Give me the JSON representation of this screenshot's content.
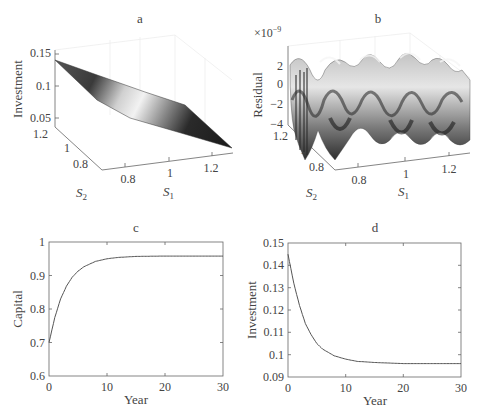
{
  "chart_data": [
    {
      "panel": "a",
      "type": "surface3d",
      "title": "a",
      "xlabel": "S1",
      "ylabel": "S2",
      "zlabel": "Investment",
      "x_ticks": [
        "0.8",
        "1",
        "1.2"
      ],
      "y_ticks": [
        "0.8",
        "1",
        "1.2"
      ],
      "z_ticks": [
        "0.05",
        "0.1",
        "0.15"
      ],
      "zlim": [
        0.05,
        0.15
      ],
      "description": "Planar-like decreasing investment surface from ~0.14 at low S1 to ~0.05 at high S1",
      "corner_values": {
        "S1_low": 0.14,
        "S1_high": 0.05
      },
      "colormap": "gray"
    },
    {
      "panel": "b",
      "type": "surface3d",
      "title": "b",
      "xlabel": "S1",
      "ylabel": "S2",
      "zlabel": "Residual",
      "z_multiplier": "×10^-9",
      "x_ticks": [
        "0.8",
        "1",
        "1.2"
      ],
      "y_ticks": [
        "0.8",
        "1",
        "1.2"
      ],
      "z_ticks": [
        "-4",
        "-2",
        "0",
        "2"
      ],
      "zlim": [
        -4,
        2.5
      ],
      "description": "Oscillatory residual surface of order 1e-9",
      "colormap": "gray"
    },
    {
      "panel": "c",
      "type": "line",
      "title": "c",
      "xlabel": "Year",
      "ylabel": "Capital",
      "xlim": [
        0,
        30
      ],
      "ylim": [
        0.6,
        1.0
      ],
      "x_ticks": [
        "0",
        "10",
        "20",
        "30"
      ],
      "y_ticks": [
        "0.6",
        "0.7",
        "0.8",
        "0.9",
        "1"
      ],
      "grid": false,
      "series": [
        {
          "name": "Capital",
          "x": [
            0,
            1,
            2,
            3,
            4,
            5,
            6,
            8,
            10,
            12,
            15,
            20,
            25,
            30
          ],
          "values": [
            0.7,
            0.775,
            0.83,
            0.868,
            0.895,
            0.913,
            0.926,
            0.942,
            0.95,
            0.954,
            0.957,
            0.958,
            0.958,
            0.958
          ]
        }
      ]
    },
    {
      "panel": "d",
      "type": "line",
      "title": "d",
      "xlabel": "Year",
      "ylabel": "Investment",
      "xlim": [
        0,
        30
      ],
      "ylim": [
        0.09,
        0.15
      ],
      "x_ticks": [
        "0",
        "10",
        "20",
        "30"
      ],
      "y_ticks": [
        "0.09",
        "0.1",
        "0.11",
        "0.12",
        "0.13",
        "0.14",
        "0.15"
      ],
      "grid": false,
      "series": [
        {
          "name": "Investment",
          "x": [
            0,
            1,
            2,
            3,
            4,
            5,
            6,
            8,
            10,
            12,
            15,
            20,
            25,
            30
          ],
          "values": [
            0.145,
            0.132,
            0.122,
            0.114,
            0.109,
            0.105,
            0.1025,
            0.0995,
            0.098,
            0.097,
            0.0965,
            0.096,
            0.096,
            0.096
          ]
        }
      ]
    }
  ],
  "labels": {
    "a": {
      "title": "a",
      "z": "Investment",
      "x": "S",
      "x_sub": "1",
      "y": "S",
      "y_sub": "2",
      "zt": [
        "0.15",
        "0.1",
        "0.05"
      ],
      "yt": [
        "1.2",
        "1",
        "0.8"
      ],
      "xt": [
        "0.8",
        "1",
        "1.2"
      ]
    },
    "b": {
      "title": "b",
      "z": "Residual",
      "mult": "×10",
      "mult_exp": "−9",
      "x": "S",
      "x_sub": "1",
      "y": "S",
      "y_sub": "2",
      "zt": [
        "2",
        "0",
        "−2",
        "−4"
      ],
      "yt": [
        "1.2",
        "1",
        "0.8"
      ],
      "xt": [
        "0.8",
        "1",
        "1.2"
      ]
    },
    "c": {
      "title": "c",
      "y": "Capital",
      "x": "Year",
      "yt": [
        "1",
        "0.9",
        "0.8",
        "0.7",
        "0.6"
      ],
      "xt": [
        "0",
        "10",
        "20",
        "30"
      ]
    },
    "d": {
      "title": "d",
      "y": "Investment",
      "x": "Year",
      "yt": [
        "0.15",
        "0.14",
        "0.13",
        "0.12",
        "0.11",
        "0.1",
        "0.09"
      ],
      "xt": [
        "0",
        "10",
        "20",
        "30"
      ]
    }
  }
}
